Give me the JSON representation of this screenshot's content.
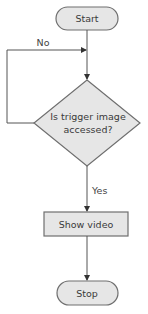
{
  "flowchart": {
    "nodes": {
      "start": {
        "label": "Start",
        "shape": "terminator"
      },
      "decision": {
        "line1": "Is trigger image",
        "line2": "accessed?",
        "shape": "diamond"
      },
      "process": {
        "label": "Show video",
        "shape": "rectangle"
      },
      "stop": {
        "label": "Stop",
        "shape": "terminator"
      }
    },
    "edges": {
      "no_label": "No",
      "yes_label": "Yes"
    },
    "colors": {
      "fill": "#e6e6e6",
      "stroke": "#6f6f6f",
      "line": "#555555"
    }
  }
}
